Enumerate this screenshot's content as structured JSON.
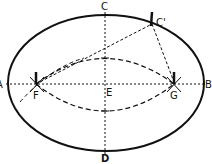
{
  "diagram": {
    "labels": {
      "A": "A",
      "B": "B",
      "C": "C",
      "D": "D",
      "E": "E",
      "F": "F",
      "G": "G",
      "C_prime": "C'"
    },
    "colors": {
      "stroke": "#111111",
      "background": "#ffffff"
    }
  }
}
